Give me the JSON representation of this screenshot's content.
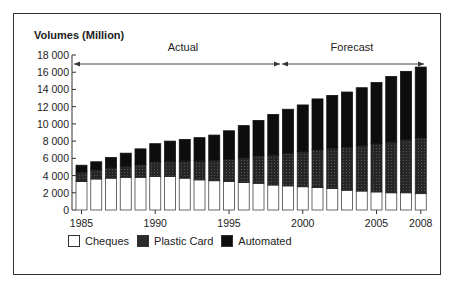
{
  "chart_data": {
    "type": "bar",
    "stacked": true,
    "title": "",
    "ylabel": "Volumes (Million)",
    "xlabel": "",
    "ylim": [
      0,
      18000
    ],
    "yticks": [
      0,
      2000,
      4000,
      6000,
      8000,
      10000,
      12000,
      14000,
      16000,
      18000
    ],
    "ytick_labels": [
      "0",
      "2 000",
      "4 000",
      "6 000",
      "8 000",
      "10 000",
      "12 000",
      "14 000",
      "16 000",
      "18 000"
    ],
    "xtick_labels": [
      "1985",
      "1990",
      "1995",
      "2000",
      "2005",
      "2008"
    ],
    "categories": [
      "1985",
      "1986",
      "1987",
      "1988",
      "1989",
      "1990",
      "1991",
      "1992",
      "1993",
      "1994",
      "1995",
      "1996",
      "1997",
      "1998",
      "1999",
      "2000",
      "2001",
      "2002",
      "2003",
      "2004",
      "2005",
      "2006",
      "2007",
      "2008"
    ],
    "series": [
      {
        "name": "Cheques",
        "color": "#ffffff",
        "values": [
          3300,
          3600,
          3700,
          3800,
          3800,
          3900,
          3900,
          3700,
          3500,
          3400,
          3300,
          3200,
          3100,
          2900,
          2800,
          2700,
          2600,
          2500,
          2300,
          2200,
          2100,
          2000,
          2000,
          1900
        ]
      },
      {
        "name": "Plastic Card",
        "color": "#2b2b2b",
        "values": [
          1100,
          1100,
          1200,
          1300,
          1500,
          1700,
          1800,
          2000,
          2200,
          2400,
          2600,
          2900,
          3200,
          3500,
          3800,
          4100,
          4400,
          4700,
          5000,
          5300,
          5600,
          5900,
          6200,
          6500
        ]
      },
      {
        "name": "Automated",
        "color": "#0d0d0d",
        "values": [
          800,
          900,
          1200,
          1500,
          1800,
          2100,
          2300,
          2500,
          2700,
          2900,
          3300,
          3700,
          4100,
          4700,
          5100,
          5400,
          5900,
          6100,
          6400,
          6700,
          7100,
          7600,
          7900,
          8200
        ]
      }
    ],
    "annotations": [
      {
        "text": "Actual",
        "span": [
          "1985",
          "1998"
        ]
      },
      {
        "text": "Forecast",
        "span": [
          "1999",
          "2008"
        ]
      }
    ],
    "grid": false,
    "legend_position": "bottom-left"
  },
  "labels": {
    "y_title": "Volumes (Million)",
    "actual": "Actual",
    "forecast": "Forecast"
  },
  "legend": [
    {
      "label": "Cheques",
      "color": "#ffffff"
    },
    {
      "label": "Plastic Card",
      "color": "#2b2b2b"
    },
    {
      "label": "Automated",
      "color": "#0d0d0d"
    }
  ]
}
